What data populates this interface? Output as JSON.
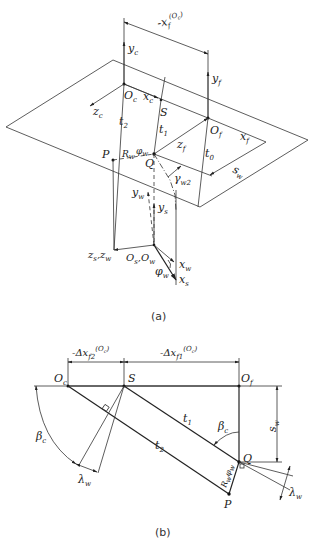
{
  "figure": {
    "panel_a": {
      "caption": "(a)",
      "labels": {
        "dim_top": "-x",
        "dim_top_sub": "f",
        "dim_top_sup": "(O",
        "dim_top_sup2": "c",
        "dim_top_sup3": ")",
        "yc": "y",
        "yc_sub": "c",
        "yf": "y",
        "yf_sub": "f",
        "Oc": "O",
        "Oc_sub": "c",
        "xc": "x",
        "xc_sub": "c",
        "zc": "z",
        "zc_sub": "c",
        "S": "S",
        "t2": "t",
        "t2_sub": "2",
        "t1": "t",
        "t1_sub": "1",
        "t0": "t",
        "t0_sub": "0",
        "Of": "O",
        "Of_sub": "f",
        "xf": "x",
        "xf_sub": "f",
        "zf": "z",
        "zf_sub": "f",
        "P": "P",
        "Rw": "R",
        "Rw_sub": "w",
        "phiw": "φ",
        "phiw_sub": "w",
        "Q": "Q",
        "gamma": "γ",
        "gamma_sub": "w2",
        "sw": "s",
        "sw_sub": "w",
        "yw": "y",
        "yw_sub": "w",
        "ys": "y",
        "ys_sub": "s",
        "zs_zw": "z",
        "zs_sub": "s",
        "zs_comma": ",z",
        "zw_sub": "w",
        "Os_Ow": "O",
        "Os_sub": "s",
        "Os_comma": ",O",
        "Ow_sub": "w",
        "xw": "x",
        "xw_sub": "w",
        "xs": "x",
        "xs_sub": "s",
        "phiw2": "φ",
        "phiw2_sub": "w"
      }
    },
    "panel_b": {
      "caption": "(b)",
      "labels": {
        "dx2": "-Δx",
        "dx2_sub": "f2",
        "dx2_sup": "(O",
        "dx2_sup2": "c",
        "dx2_sup3": ")",
        "dx1": "-Δx",
        "dx1_sub": "f1",
        "dx1_sup": "(O",
        "dx1_sup2": "c",
        "dx1_sup3": ")",
        "Oc": "O",
        "Oc_sub": "c",
        "S": "S",
        "Of": "O",
        "Of_sub": "f",
        "t1": "t",
        "t1_sub": "1",
        "t2": "t",
        "t2_sub": "2",
        "beta_right": "β",
        "beta_right_sub": "c",
        "beta_left": "β",
        "beta_left_sub": "c",
        "sw": "s",
        "sw_sub": "w",
        "Q": "Q",
        "P": "P",
        "Rw": "R",
        "Rw_sub": "w",
        "phiw": "φ",
        "phiw_sub": "w",
        "lambda_left": "λ",
        "lambda_left_sub": "w",
        "lambda_right": "λ",
        "lambda_right_sub": "w"
      }
    }
  }
}
